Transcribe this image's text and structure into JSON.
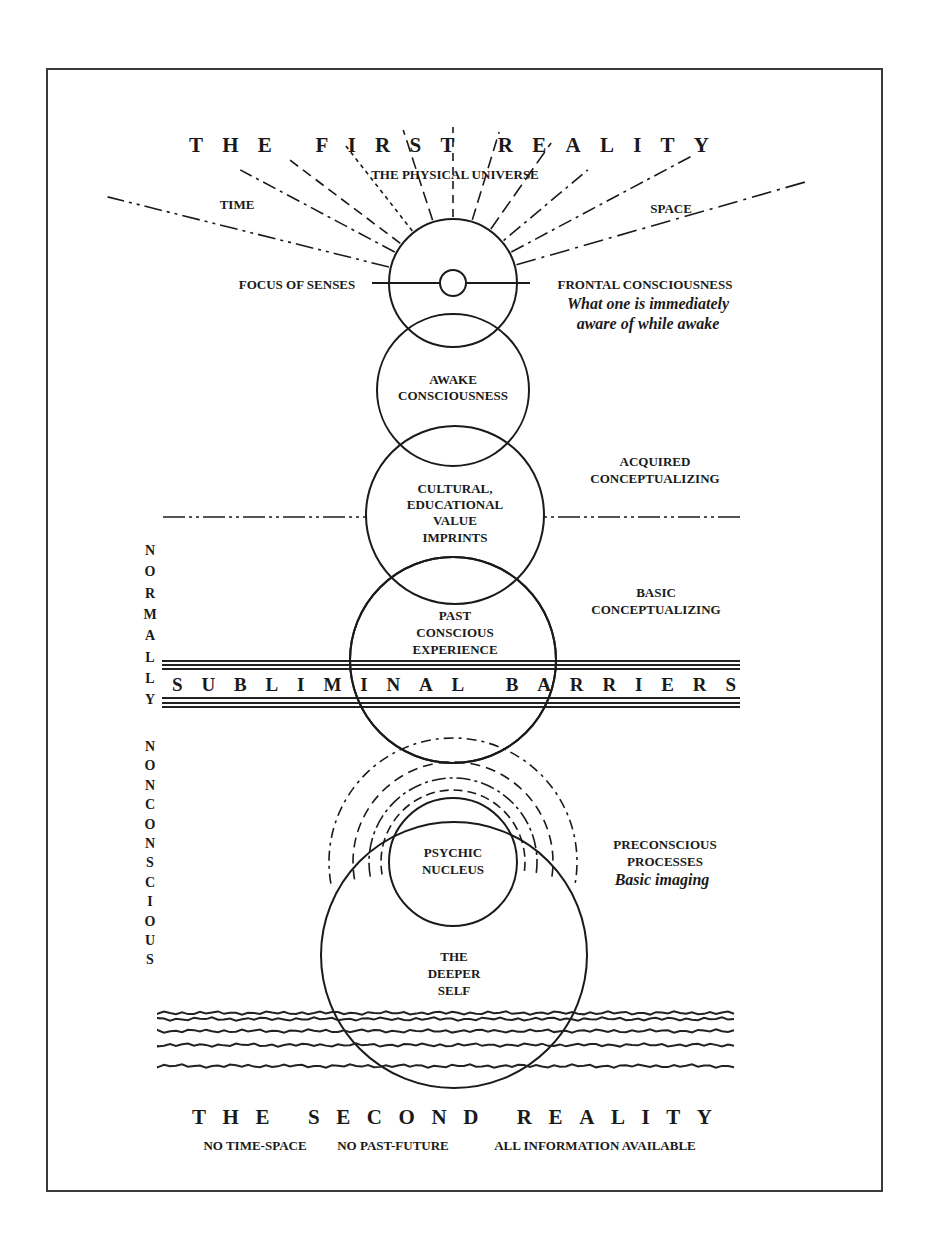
{
  "diagram": {
    "top_title": "THE FIRST REALITY",
    "bottom_title": "THE SECOND REALITY",
    "bottom_notes": [
      "NO TIME-SPACE",
      "NO PAST-FUTURE",
      "ALL INFORMATION AVAILABLE"
    ],
    "top_labels": {
      "physical_universe": "THE PHYSICAL UNIVERSE",
      "time": "TIME",
      "space": "SPACE",
      "focus_of_senses": "FOCUS OF SENSES",
      "frontal_consciousness": "FRONTAL CONSCIOUSNESS",
      "frontal_note_line1": "What one is immediately",
      "frontal_note_line2": "aware of while awake"
    },
    "circles": [
      {
        "id": "frontal",
        "lines": []
      },
      {
        "id": "awake",
        "lines": [
          "AWAKE",
          "CONSCIOUSNESS"
        ]
      },
      {
        "id": "cultural",
        "lines": [
          "CULTURAL,",
          "EDUCATIONAL",
          "VALUE",
          "IMPRINTS"
        ]
      },
      {
        "id": "past",
        "lines": [
          "PAST",
          "CONSCIOUS",
          "EXPERIENCE"
        ]
      },
      {
        "id": "psychic",
        "lines": [
          "PSYCHIC",
          "NUCLEUS"
        ]
      },
      {
        "id": "deeper",
        "lines": [
          "THE",
          "DEEPER",
          "SELF"
        ]
      }
    ],
    "side_labels": {
      "acquired": [
        "ACQUIRED",
        "CONCEPTUALIZING"
      ],
      "basic": [
        "BASIC",
        "CONCEPTUALIZING"
      ],
      "preconscious": [
        "PRECONSCIOUS",
        "PROCESSES"
      ],
      "preconscious_note": "Basic imaging"
    },
    "barrier_text": "SUBLIMINAL BARRIERS",
    "vertical_left": {
      "upper": "NORMALLY",
      "lower": "NONCONSCIOUS"
    }
  }
}
